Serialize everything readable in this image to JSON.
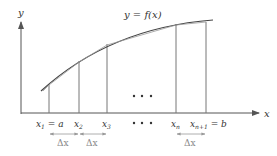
{
  "diagram": {
    "type": "riemann-partition",
    "curve_label": "y = f(x)",
    "axes": {
      "x_label": "x",
      "y_label": "y"
    },
    "partition_labels": [
      {
        "main": "x",
        "sub": "1",
        "suffix": " = a"
      },
      {
        "main": "x",
        "sub": "2",
        "suffix": ""
      },
      {
        "main": "x",
        "sub": "3",
        "suffix": ""
      },
      {
        "main": "x",
        "sub": "n",
        "suffix": ""
      },
      {
        "main": "x",
        "sub": "n+1",
        "suffix": " = b"
      }
    ],
    "ellipsis": "• • •",
    "delta_label": "Δx",
    "colors": {
      "axis": "#555555",
      "curve": "#444444",
      "lines": "#777777",
      "delta": "#999999"
    }
  }
}
